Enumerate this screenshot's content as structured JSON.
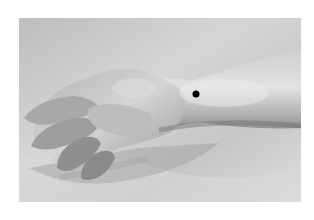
{
  "image": {
    "description": "Grayscale photograph of a relaxed left hand and forearm resting palm-down on a white cloth, with a black dot marking a point on the back of the wrist/forearm",
    "style": "grayscale photograph",
    "marker": {
      "shape": "dot",
      "color": "#000000",
      "position_px": [
        196,
        94
      ],
      "radius_px": 3.5
    },
    "colors": {
      "background": "#ffffff",
      "cloth": "#cfcfcf",
      "skin_light": "#d8d8d8",
      "skin_shadow": "#8a8a8a"
    }
  }
}
